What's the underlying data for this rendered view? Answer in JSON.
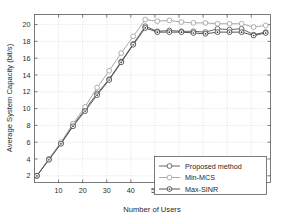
{
  "chart_data": {
    "type": "line",
    "title": "",
    "xlabel": "Number of Users",
    "ylabel": "Average System Capacity (bit/s)",
    "xlim": [
      0,
      98
    ],
    "ylim": [
      1.2,
      21.2
    ],
    "xticks": [
      10,
      20,
      30,
      40,
      50,
      60,
      70,
      80,
      90
    ],
    "yticks": [
      2,
      4,
      6,
      8,
      10,
      12,
      14,
      16,
      18,
      20
    ],
    "grid": true,
    "legend_position": "lower-right",
    "x": [
      1,
      6,
      11,
      16,
      21,
      26,
      31,
      36,
      41,
      46,
      51,
      56,
      61,
      66,
      71,
      76,
      81,
      86,
      91,
      96
    ],
    "series": [
      {
        "name": "Proposed method",
        "color": "#4d4d4d",
        "marker": "circle",
        "values": [
          2.0,
          4.0,
          5.9,
          8.0,
          9.9,
          11.8,
          13.5,
          15.6,
          17.7,
          19.8,
          19.2,
          19.3,
          19.2,
          19.2,
          19.1,
          19.5,
          19.4,
          19.5,
          18.8,
          19.1
        ]
      },
      {
        "name": "Min-MCS",
        "color": "#9a9a9a",
        "marker": "circle",
        "values": [
          2.0,
          4.0,
          6.0,
          8.2,
          10.2,
          12.5,
          14.5,
          16.6,
          18.6,
          20.6,
          20.4,
          20.5,
          20.3,
          20.2,
          20.2,
          20.1,
          20.1,
          20.1,
          19.7,
          19.9
        ]
      },
      {
        "name": "Max-SINR",
        "color": "#3a3a3a",
        "marker": "circle-dot",
        "values": [
          2.0,
          3.9,
          5.8,
          7.9,
          9.7,
          11.6,
          13.4,
          15.5,
          17.6,
          19.6,
          19.1,
          19.1,
          19.1,
          19.0,
          18.9,
          19.1,
          19.1,
          19.1,
          18.7,
          19.0
        ]
      }
    ],
    "colors": {
      "axis": "#5a5a5a",
      "grid": "#c9c9c9",
      "background": "#ffffff",
      "proposed": "#4d4d4d",
      "min_mcs": "#9a9a9a",
      "max_sinr": "#3a3a3a"
    }
  }
}
